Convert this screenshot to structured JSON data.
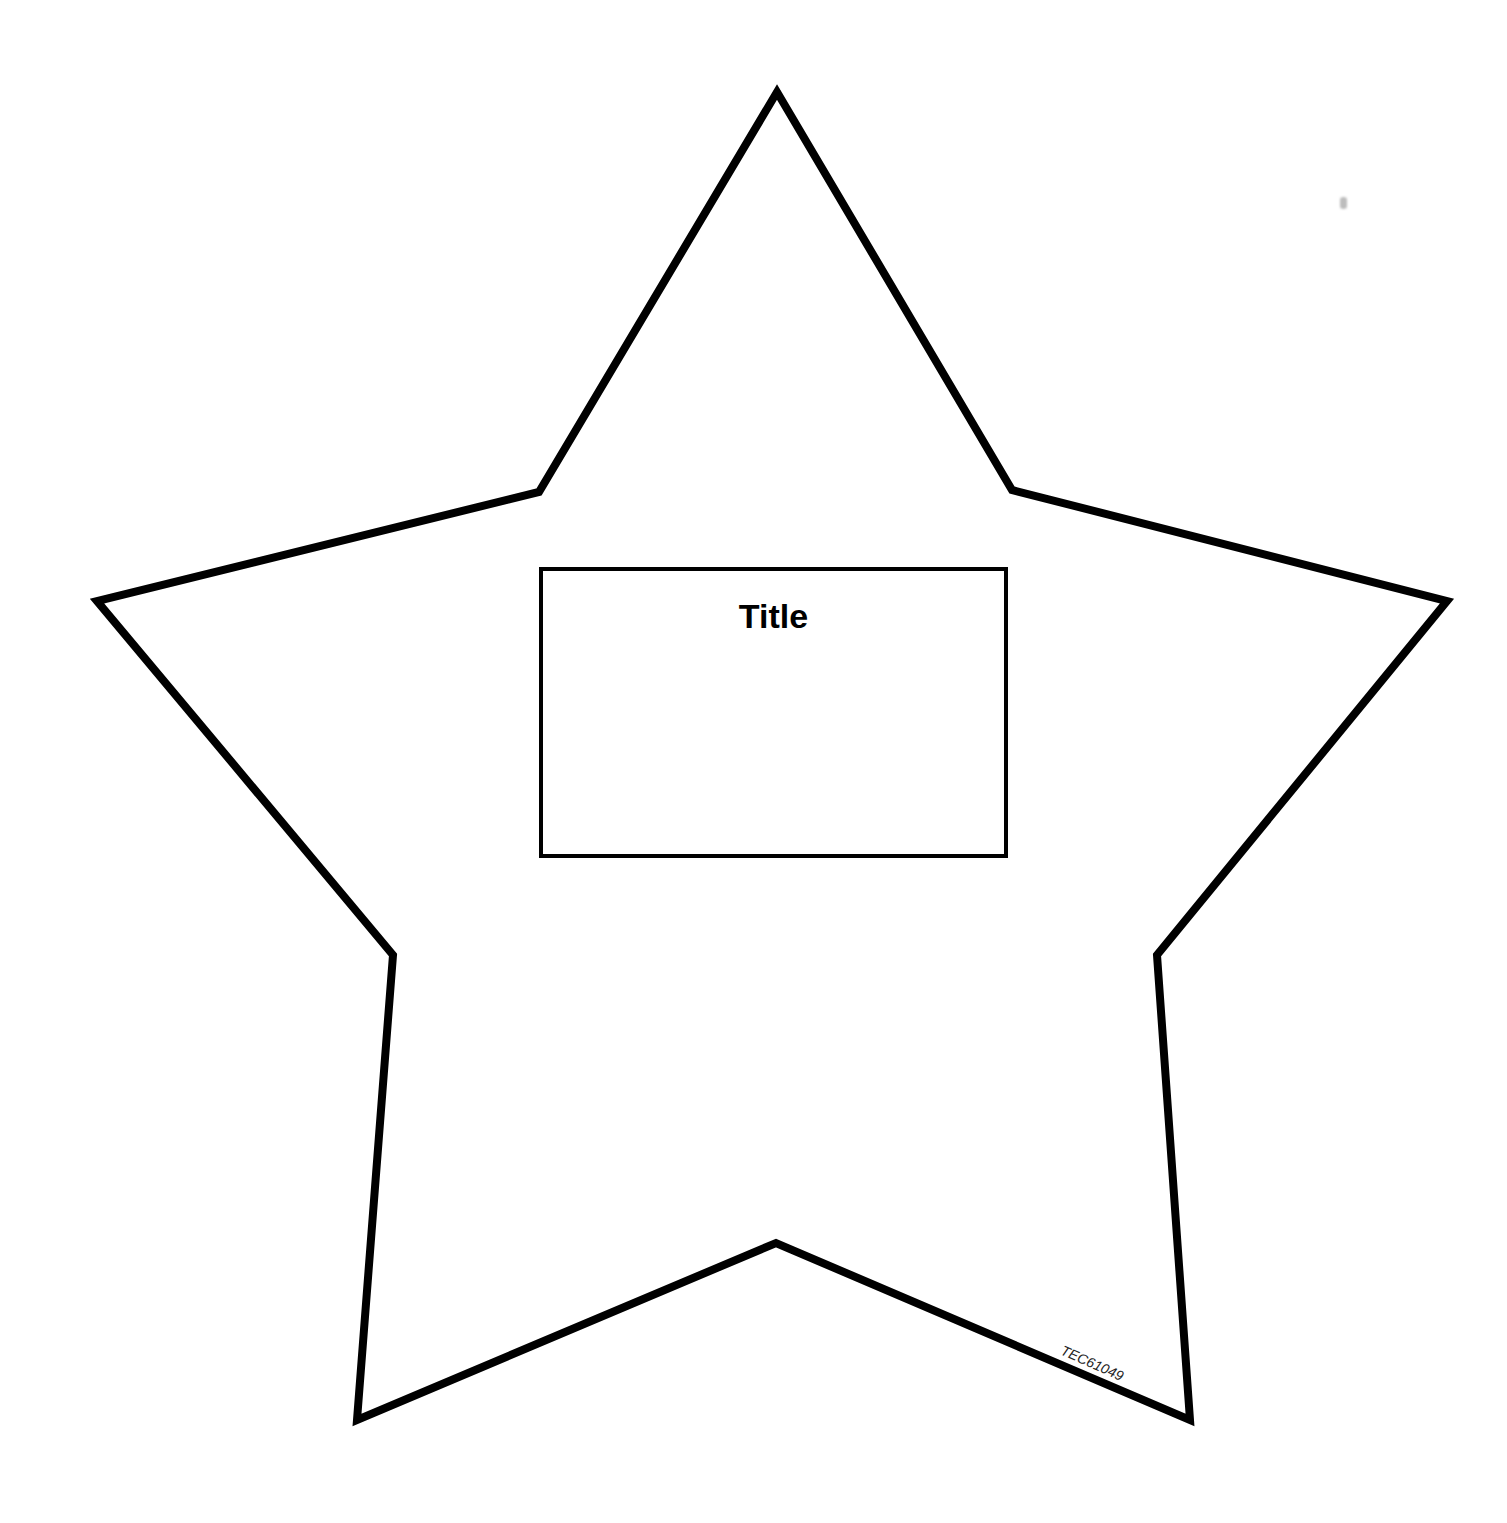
{
  "page": {
    "background_color": "#ffffff",
    "outline_color": "#000000"
  },
  "star": {
    "shape": "five-point-star",
    "stroke_width": 8,
    "points": [
      [
        777,
        92
      ],
      [
        1012,
        490
      ],
      [
        1447,
        601
      ],
      [
        1157,
        955
      ],
      [
        1190,
        1420
      ],
      [
        776,
        1243
      ],
      [
        357,
        1420
      ],
      [
        393,
        955
      ],
      [
        97,
        601
      ],
      [
        539,
        492
      ]
    ]
  },
  "title_box": {
    "title": "Title",
    "content": ""
  },
  "footer": {
    "product_code": "TEC61049"
  }
}
